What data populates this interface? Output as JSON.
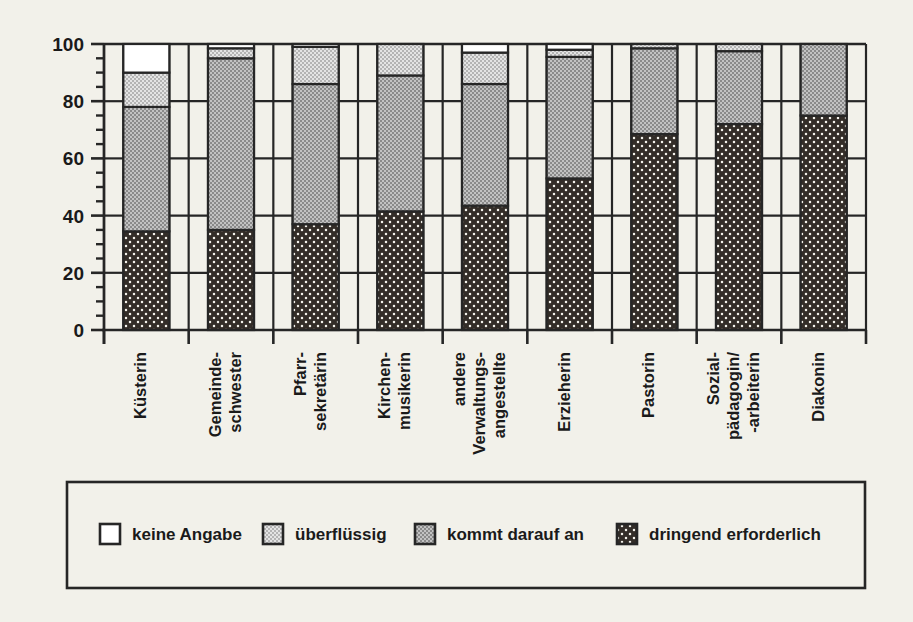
{
  "chart_data": {
    "type": "bar",
    "subtype": "stacked-100-percent",
    "title": "",
    "xlabel": "",
    "ylabel": "",
    "ylim": [
      0,
      100
    ],
    "y_ticks": [
      0,
      20,
      40,
      60,
      80,
      100
    ],
    "y_tick_labels": [
      "0",
      "20",
      "40",
      "60",
      "80",
      "100"
    ],
    "y_minor_tick_step": 5,
    "grid": "horizontal-between-bars",
    "legend_position": "bottom",
    "categories": [
      "Küsterin",
      "Gemeinde-\nschwester",
      "Pfarr-\nsekretärin",
      "Kirchen-\nmusikerin",
      "andere\nVerwaltungs-\nangestellte",
      "Erzieherin",
      "Pastorin",
      "Sozial-\npädagogin/\n-arbeiterin",
      "Diakonin"
    ],
    "category_lines": [
      [
        "Küsterin"
      ],
      [
        "Gemeinde-",
        "schwester"
      ],
      [
        "Pfarr-",
        "sekretärin"
      ],
      [
        "Kirchen-",
        "musikerin"
      ],
      [
        "andere",
        "Verwaltungs-",
        "angestellte"
      ],
      [
        "Erzieherin"
      ],
      [
        "Pastorin"
      ],
      [
        "Sozial-",
        "pädagogin/",
        "-arbeiterin"
      ],
      [
        "Diakonin"
      ]
    ],
    "series": [
      {
        "name": "dringend erforderlich",
        "pattern": "dark-dotted",
        "color": "#332d28",
        "values": [
          34.5,
          35.0,
          37.0,
          41.5,
          43.5,
          53.0,
          68.5,
          72.0,
          75.0
        ]
      },
      {
        "name": "kommt darauf an",
        "pattern": "mid-gray-check",
        "color": "#a8a8a8",
        "values": [
          43.5,
          60.0,
          49.0,
          47.5,
          42.5,
          42.5,
          30.0,
          25.5,
          25.0
        ]
      },
      {
        "name": "überflüssig",
        "pattern": "light-gray-check",
        "color": "#cfcfcf",
        "values": [
          12.0,
          3.5,
          13.0,
          11.0,
          11.0,
          2.5,
          1.5,
          2.5,
          0.0
        ]
      },
      {
        "name": "keine Angabe",
        "pattern": "white",
        "color": "#ffffff",
        "values": [
          10.0,
          1.5,
          1.0,
          0.0,
          3.0,
          2.0,
          0.0,
          0.0,
          0.0
        ]
      }
    ]
  },
  "legend": {
    "items": [
      {
        "label": "keine Angabe",
        "swatch": "white"
      },
      {
        "label": "überflüssig",
        "swatch": "light-gray-check"
      },
      {
        "label": "kommt darauf an",
        "swatch": "mid-gray-check"
      },
      {
        "label": "dringend erforderlich",
        "swatch": "dark-dotted"
      }
    ]
  },
  "colors": {
    "background": "#f2f1ea",
    "axis": "#262626",
    "white_fill": "#ffffff",
    "light_gray": "#cfcfcf",
    "mid_gray": "#a8a8a8",
    "dark": "#332d28"
  }
}
